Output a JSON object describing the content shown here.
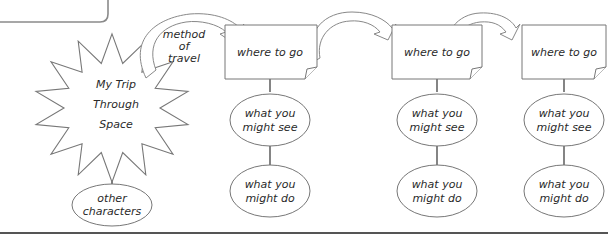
{
  "diagram": {
    "title_lines": [
      "My Trip",
      "Through",
      "Space"
    ],
    "other_characters_lines": [
      "other",
      "characters"
    ],
    "method_of_travel_lines": [
      "method",
      "of",
      "travel"
    ],
    "columns": [
      {
        "where": "where to go",
        "see_lines": [
          "what you",
          "might see"
        ],
        "do_lines": [
          "what you",
          "might do"
        ]
      },
      {
        "where": "where to go",
        "see_lines": [
          "what you",
          "might see"
        ],
        "do_lines": [
          "what you",
          "might do"
        ]
      },
      {
        "where": "where to go",
        "see_lines": [
          "what you",
          "might see"
        ],
        "do_lines": [
          "what you",
          "might do"
        ]
      }
    ],
    "colors": {
      "stroke": "#6f6f6f",
      "connector": "#333333",
      "text": "#2a2a2a",
      "frame": "#8a8a8a"
    }
  }
}
